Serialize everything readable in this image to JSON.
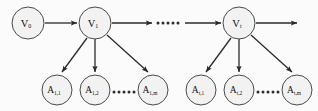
{
  "figure": {
    "type": "directed-graph",
    "background_color": "#fbfbfb",
    "node_fill_color": "#f2f2f2",
    "node_stroke_color": "#4a4a4a",
    "edge_color": "#2b2b2b",
    "label_color": "#111111"
  },
  "nodes": {
    "v_start": {
      "base": "V",
      "subscript": "0",
      "cx": 28,
      "cy": 23,
      "r": 16
    },
    "v_first": {
      "base": "V",
      "subscript": "1",
      "cx": 95,
      "cy": 23,
      "r": 16
    },
    "v_t": {
      "base": "V",
      "subscript": "t",
      "cx": 239,
      "cy": 23,
      "r": 16
    },
    "a1_1": {
      "base": "A",
      "subscript": "1,1",
      "cx": 57,
      "cy": 90,
      "r": 15
    },
    "a1_2": {
      "base": "A",
      "subscript": "1,2",
      "cx": 95,
      "cy": 90,
      "r": 15
    },
    "a1_m": {
      "base": "A",
      "subscript": "1,m",
      "cx": 153,
      "cy": 90,
      "r": 15
    },
    "at_1": {
      "base": "A",
      "subscript": "t,1",
      "cx": 201,
      "cy": 90,
      "r": 15
    },
    "at_2": {
      "base": "A",
      "subscript": "t,2",
      "cx": 239,
      "cy": 90,
      "r": 15
    },
    "at_m": {
      "base": "A",
      "subscript": "t,m",
      "cx": 297,
      "cy": 90,
      "r": 15
    }
  },
  "ellipses": {
    "top_row_dots": {
      "count": 5,
      "cx": 168,
      "cy": 23,
      "spacing": 5,
      "radius": 1.5
    },
    "bottom_left_dots": {
      "count": 5,
      "cx": 124,
      "cy": 92,
      "spacing": 5,
      "radius": 1.5
    },
    "bottom_right_dots": {
      "count": 5,
      "cx": 268,
      "cy": 92,
      "spacing": 5,
      "radius": 1.5
    }
  },
  "edges": [
    {
      "name": "v0-to-v1",
      "from": "v_start",
      "to": "v_first"
    },
    {
      "name": "v1-to-ellipsis",
      "from": "v_first",
      "to": "top_row_dots"
    },
    {
      "name": "ellipsis-to-vt",
      "from": "top_row_dots",
      "to": "v_t"
    },
    {
      "name": "vt-to-next",
      "from": "v_t",
      "to": "right-edge"
    },
    {
      "name": "v1-to-a1-1",
      "from": "v_first",
      "to": "a1_1"
    },
    {
      "name": "v1-to-a1-2",
      "from": "v_first",
      "to": "a1_2"
    },
    {
      "name": "v1-to-a1-m",
      "from": "v_first",
      "to": "a1_m"
    },
    {
      "name": "vt-to-at-1",
      "from": "v_t",
      "to": "at_1"
    },
    {
      "name": "vt-to-at-2",
      "from": "v_t",
      "to": "at_2"
    },
    {
      "name": "vt-to-at-m",
      "from": "v_t",
      "to": "at_m"
    }
  ]
}
